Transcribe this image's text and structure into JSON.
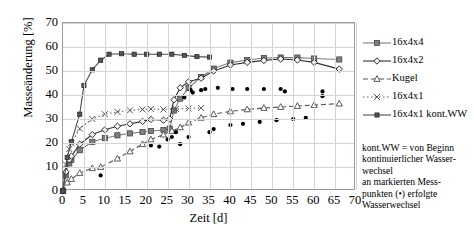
{
  "chart_data": {
    "type": "line",
    "title": "",
    "xlabel": "Zeit [d]",
    "ylabel": "Masseänderung [%]",
    "xlim": [
      0,
      70
    ],
    "ylim": [
      0,
      70
    ],
    "xticks": [
      0,
      5,
      10,
      15,
      20,
      25,
      30,
      35,
      40,
      45,
      50,
      55,
      60,
      65,
      70
    ],
    "yticks": [
      0,
      10,
      20,
      30,
      40,
      50,
      60,
      70
    ],
    "grid": true,
    "legend_position": "right",
    "series": [
      {
        "name": "16x4x4",
        "marker": "square",
        "color": "#7f7f7f",
        "linestyle": "solid",
        "points": [
          [
            0,
            0
          ],
          [
            0.3,
            3.5
          ],
          [
            0.7,
            6.5
          ],
          [
            1,
            9.5
          ],
          [
            1.5,
            11.5
          ],
          [
            2,
            13.0
          ],
          [
            4,
            17.0
          ],
          [
            7,
            20.5
          ],
          [
            10,
            22.0
          ],
          [
            13,
            23.2
          ],
          [
            16,
            24.0
          ],
          [
            19,
            24.6
          ],
          [
            21,
            25.0
          ],
          [
            24,
            25.4
          ],
          [
            25.5,
            26.0
          ],
          [
            26.5,
            33.5
          ],
          [
            28,
            38.5
          ],
          [
            30,
            43.0
          ],
          [
            33,
            47.5
          ],
          [
            36,
            51.0
          ],
          [
            40,
            53.5
          ],
          [
            44,
            54.6
          ],
          [
            48,
            55.4
          ],
          [
            52,
            55.6
          ],
          [
            56,
            55.6
          ],
          [
            60,
            55.2
          ],
          [
            66,
            54.8
          ]
        ]
      },
      {
        "name": "16x4x2",
        "marker": "diamond",
        "color": "#333333",
        "linestyle": "solid",
        "points": [
          [
            0,
            0
          ],
          [
            0.3,
            4.5
          ],
          [
            0.7,
            8.0
          ],
          [
            1,
            11.0
          ],
          [
            1.5,
            13.0
          ],
          [
            2,
            14.5
          ],
          [
            4,
            19.5
          ],
          [
            7,
            23.5
          ],
          [
            10,
            25.5
          ],
          [
            13,
            27.0
          ],
          [
            16,
            28.0
          ],
          [
            19,
            29.0
          ],
          [
            21,
            29.8
          ],
          [
            24,
            29.5
          ],
          [
            25.5,
            30.0
          ],
          [
            26.5,
            38.0
          ],
          [
            28,
            43.0
          ],
          [
            30,
            45.5
          ],
          [
            33,
            47.0
          ],
          [
            36,
            50.0
          ],
          [
            40,
            52.5
          ],
          [
            44,
            53.6
          ],
          [
            48,
            54.4
          ],
          [
            52,
            55.0
          ],
          [
            56,
            54.6
          ],
          [
            60,
            53.6
          ],
          [
            66,
            50.8
          ]
        ]
      },
      {
        "name": "Kugel",
        "marker": "triangle-open",
        "color": "#555555",
        "linestyle": "dashed",
        "points": [
          [
            0,
            0
          ],
          [
            0.5,
            2.0
          ],
          [
            1,
            3.5
          ],
          [
            2,
            5.0
          ],
          [
            4,
            7.5
          ],
          [
            7,
            9.5
          ],
          [
            9,
            10.0
          ],
          [
            13,
            13.5
          ],
          [
            16,
            16.5
          ],
          [
            19,
            19.5
          ],
          [
            21,
            21.5
          ],
          [
            24,
            23.5
          ],
          [
            26,
            25.0
          ],
          [
            28,
            26.5
          ],
          [
            30,
            28.5
          ],
          [
            33,
            30.5
          ],
          [
            36,
            32.0
          ],
          [
            40,
            33.2
          ],
          [
            44,
            34.0
          ],
          [
            48,
            34.6
          ],
          [
            52,
            35.0
          ],
          [
            56,
            35.4
          ],
          [
            60,
            35.8
          ],
          [
            66,
            36.4
          ]
        ]
      },
      {
        "name": "16x4x1",
        "marker": "cross",
        "color": "#666666",
        "linestyle": "dotted",
        "points": [
          [
            0,
            0
          ],
          [
            0.3,
            6.0
          ],
          [
            0.7,
            11.0
          ],
          [
            1,
            14.5
          ],
          [
            1.5,
            17.5
          ],
          [
            2,
            20.0
          ],
          [
            4,
            26.0
          ],
          [
            7,
            30.0
          ],
          [
            10,
            32.0
          ],
          [
            13,
            33.0
          ],
          [
            16,
            33.6
          ],
          [
            19,
            34.0
          ],
          [
            21,
            34.2
          ],
          [
            24,
            34.0
          ],
          [
            27,
            34.2
          ],
          [
            30,
            34.4
          ],
          [
            33,
            34.6
          ]
        ]
      },
      {
        "name": "16x4x1 kont.WW",
        "marker": "square-small",
        "color": "#4d4d4d",
        "linestyle": "solid",
        "points": [
          [
            0,
            0
          ],
          [
            0.5,
            8.0
          ],
          [
            1,
            14.0
          ],
          [
            2,
            20.5
          ],
          [
            4,
            32.0
          ],
          [
            5,
            44.0
          ],
          [
            7,
            50.5
          ],
          [
            9,
            54.5
          ],
          [
            11,
            57.0
          ],
          [
            14,
            57.2
          ],
          [
            17,
            57.0
          ],
          [
            20,
            57.0
          ],
          [
            23,
            57.0
          ],
          [
            26,
            57.0
          ],
          [
            29,
            56.5
          ],
          [
            32,
            56.0
          ],
          [
            35,
            55.8
          ]
        ]
      }
    ],
    "water_change_points": {
      "name": "an markierten Messpunkten erfolgte Wasserwechsel",
      "marker": "dot",
      "color": "#000000",
      "points": [
        [
          9,
          6.5
        ],
        [
          21,
          19.0
        ],
        [
          23,
          18.5
        ],
        [
          25,
          21.5
        ],
        [
          26,
          22.5
        ],
        [
          27,
          24.5
        ],
        [
          28,
          19.5
        ],
        [
          30,
          22.5
        ],
        [
          29,
          39.0
        ],
        [
          31,
          41.0
        ],
        [
          30.5,
          42.0
        ],
        [
          33,
          42.0
        ],
        [
          35,
          24.5
        ],
        [
          34,
          42.5
        ],
        [
          36,
          25.8
        ],
        [
          37,
          43.0
        ],
        [
          40,
          27.5
        ],
        [
          40.5,
          42.5
        ],
        [
          43,
          28.0
        ],
        [
          44,
          42.5
        ],
        [
          47,
          28.8
        ],
        [
          48,
          42.5
        ],
        [
          51,
          29.5
        ],
        [
          52,
          42.5
        ],
        [
          53,
          41.5
        ],
        [
          55,
          30.0
        ],
        [
          58,
          30.5
        ],
        [
          62,
          41.5
        ],
        [
          62,
          39.5
        ]
      ]
    }
  },
  "legend": {
    "items": [
      {
        "label": "16x4x4"
      },
      {
        "label": "16x4x2"
      },
      {
        "label": "Kugel"
      },
      {
        "label": "16x4x1"
      },
      {
        "label": "16x4x1 kont.WW"
      }
    ]
  },
  "note": {
    "lines": [
      "kont.WW = von Beginn",
      "kontinuierlicher Wasser-",
      "wechsel",
      "an markierten Mess-",
      "punkten (•) erfolgte",
      "Wasserwechsel"
    ]
  }
}
